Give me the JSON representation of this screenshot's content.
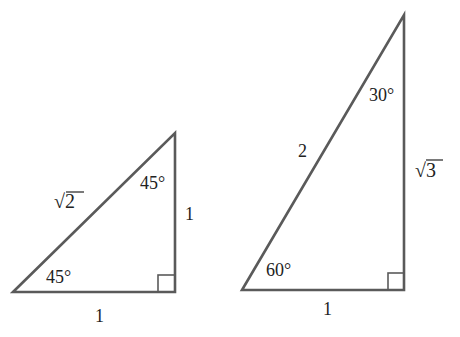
{
  "colors": {
    "stroke": "#5a5a5a",
    "text": "#222222",
    "background": "#ffffff"
  },
  "triangles": [
    {
      "name": "45-45-90",
      "hypotenuse_label": "√2",
      "top_angle_label": "45°",
      "bottom_angle_label": "45°",
      "vertical_leg_label": "1",
      "base_label": "1",
      "right_angle_marker": true
    },
    {
      "name": "30-60-90",
      "hypotenuse_label": "2",
      "top_angle_label": "30°",
      "bottom_angle_label": "60°",
      "vertical_leg_label": "√3",
      "base_label": "1",
      "right_angle_marker": true
    }
  ]
}
